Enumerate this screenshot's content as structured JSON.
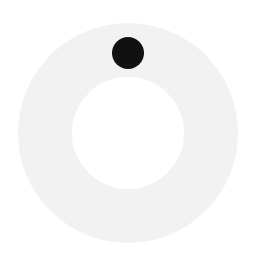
{
  "spinner": {
    "ring_color": "#f2f2f2",
    "dot_color": "#111111",
    "background": "#ffffff",
    "state": "loading"
  }
}
